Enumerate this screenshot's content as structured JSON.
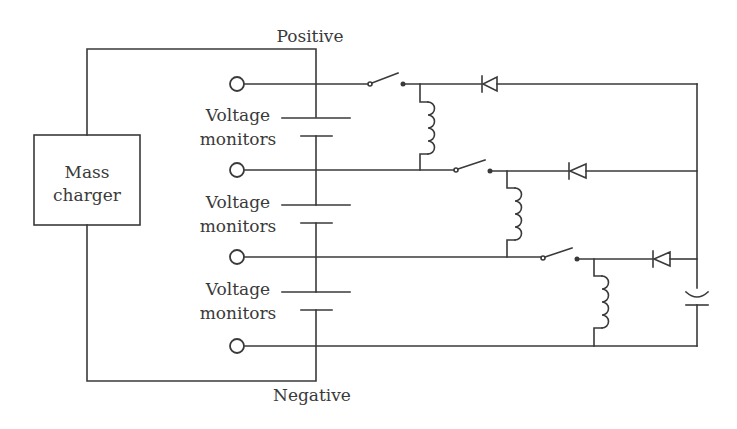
{
  "diagram": {
    "type": "circuit-schematic",
    "labels": {
      "positive": "Positive",
      "negative": "Negative",
      "charger_line1": "Mass",
      "charger_line2": "charger",
      "monitor_line1": "Voltage",
      "monitor_line2": "monitors"
    },
    "cells": [
      {
        "label1": "Voltage",
        "label2": "monitors"
      },
      {
        "label1": "Voltage",
        "label2": "monitors"
      },
      {
        "label1": "Voltage",
        "label2": "monitors"
      }
    ],
    "stages": [
      {
        "components": [
          "terminal",
          "switch",
          "inductor",
          "diode"
        ]
      },
      {
        "components": [
          "terminal",
          "switch",
          "inductor",
          "diode"
        ]
      },
      {
        "components": [
          "terminal",
          "switch",
          "inductor",
          "diode"
        ]
      }
    ],
    "output": {
      "component": "capacitor"
    },
    "colors": {
      "line": "#3a3a3a",
      "background": "#ffffff"
    }
  }
}
